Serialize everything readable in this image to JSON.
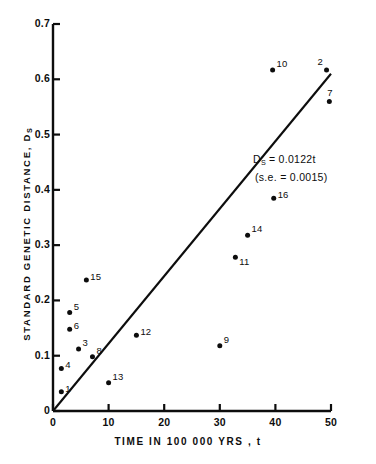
{
  "chart_data": {
    "type": "scatter",
    "title": "",
    "xlabel": "TIME IN 100 000 YRS , t",
    "ylabel": "STANDARD GENETIC DISTANCE, D",
    "ylabel_sub": "S",
    "xlim": [
      0,
      50
    ],
    "ylim": [
      0,
      0.7
    ],
    "xticks": [
      "0",
      "10",
      "20",
      "30",
      "40",
      "50"
    ],
    "xtick_values": [
      0,
      10,
      20,
      30,
      40,
      50
    ],
    "yticks": [
      "0",
      "0.1",
      "0.2",
      "0.3",
      "0.4",
      "0.5",
      "0.6",
      "0.7"
    ],
    "ytick_values": [
      0,
      0.1,
      0.2,
      0.3,
      0.4,
      0.5,
      0.6,
      0.7
    ],
    "grid": false,
    "legend": "none",
    "marker_color": "#0d0d0d",
    "line_color": "#0d0d0d",
    "points": [
      {
        "label": "1",
        "x": 1.5,
        "y": 0.035,
        "label_pos": "right"
      },
      {
        "label": "4",
        "x": 1.5,
        "y": 0.077,
        "label_pos": "right"
      },
      {
        "label": "5",
        "x": 3.0,
        "y": 0.178,
        "label_pos": "above-right"
      },
      {
        "label": "6",
        "x": 3.0,
        "y": 0.148,
        "label_pos": "right"
      },
      {
        "label": "3",
        "x": 4.6,
        "y": 0.112,
        "label_pos": "above-right"
      },
      {
        "label": "15",
        "x": 6.0,
        "y": 0.237,
        "label_pos": "right"
      },
      {
        "label": "8",
        "x": 7.1,
        "y": 0.098,
        "label_pos": "above-right"
      },
      {
        "label": "13",
        "x": 10.0,
        "y": 0.051,
        "label_pos": "above-right"
      },
      {
        "label": "12",
        "x": 15.0,
        "y": 0.137,
        "label_pos": "right"
      },
      {
        "label": "9",
        "x": 30.0,
        "y": 0.118,
        "label_pos": "above-right"
      },
      {
        "label": "11",
        "x": 32.8,
        "y": 0.278,
        "label_pos": "below-right"
      },
      {
        "label": "14",
        "x": 35.0,
        "y": 0.318,
        "label_pos": "above-right"
      },
      {
        "label": "16",
        "x": 39.7,
        "y": 0.385,
        "label_pos": "right"
      },
      {
        "label": "10",
        "x": 39.5,
        "y": 0.617,
        "label_pos": "above-right"
      },
      {
        "label": "2",
        "x": 49.2,
        "y": 0.617,
        "label_pos": "above-left"
      },
      {
        "label": "7",
        "x": 49.7,
        "y": 0.56,
        "label_pos": "above"
      }
    ],
    "fit_line": {
      "slope": 0.0122,
      "intercept": 0,
      "x_start": 0,
      "x_end": 50,
      "equation": "D",
      "equation_sub": "S",
      "equation_rest": " = 0.0122t",
      "std_error_text": "(s.e. = 0.0015)"
    }
  }
}
